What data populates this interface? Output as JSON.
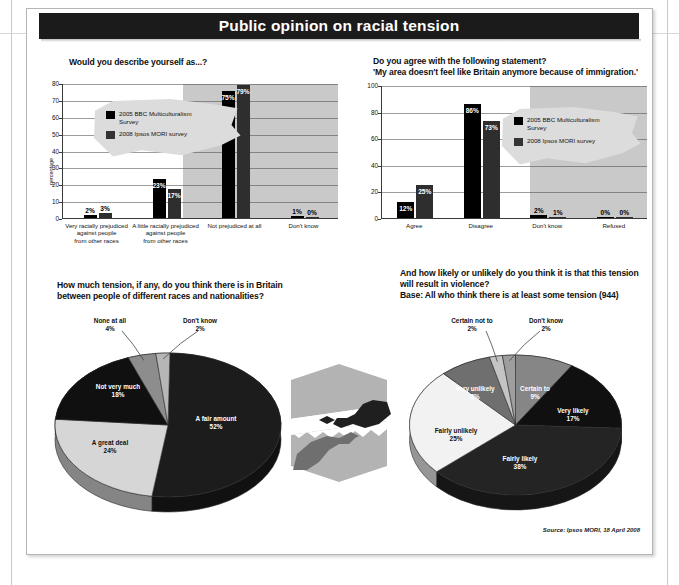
{
  "header": {
    "title": "Public opinion on racial tension"
  },
  "source": "Source: Ipsos MORI, 18 April 2008",
  "legend": {
    "series1": "2005 BBC Multiculturalism Survey",
    "series1_line1": "2005 BBC Multiculturalism",
    "series1_line2": "Survey",
    "series2": "2008 Ipsos MORI survey",
    "color1": "#000000",
    "color2": "#333333"
  },
  "chart_data": [
    {
      "type": "bar",
      "id": "self-description",
      "title": "Would you describe yourself as...?",
      "ylabel": "percentage",
      "xlabel": "",
      "ylim": [
        0,
        80
      ],
      "yticks": [
        0,
        10,
        20,
        30,
        40,
        50,
        60,
        70,
        80
      ],
      "grid": true,
      "categories": [
        "Very racially prejudiced against people from other races",
        "A little racially prejudiced against people from other races",
        "Not prejudiced at all",
        "Don't know"
      ],
      "category_lines": [
        [
          "Very racially prejudiced",
          "against people",
          "from other races"
        ],
        [
          "A little racially prejudiced",
          "against people",
          "from other races"
        ],
        [
          "Not prejudiced at all"
        ],
        [
          "Don't know"
        ]
      ],
      "series": [
        {
          "name": "2005 BBC Multiculturalism Survey",
          "values": [
            2,
            23,
            75,
            1
          ],
          "labels": [
            "2%",
            "23%",
            "75%",
            "1%"
          ]
        },
        {
          "name": "2008 Ipsos MORI survey",
          "values": [
            3,
            17,
            79,
            0
          ],
          "labels": [
            "3%",
            "17%",
            "79%",
            "0%"
          ]
        }
      ],
      "legend_position": "upper-left"
    },
    {
      "type": "bar",
      "id": "area-immigration",
      "title_line1": "Do you agree with the following statement?",
      "title_line2": "'My area doesn't feel like Britain anymore because of immigration.'",
      "ylabel": "",
      "ylim": [
        0,
        100
      ],
      "yticks": [
        0,
        20,
        40,
        60,
        80,
        100
      ],
      "grid": true,
      "categories": [
        "Agree",
        "Disagree",
        "Don't know",
        "Refused"
      ],
      "series": [
        {
          "name": "2005 BBC Multiculturalism Survey",
          "values": [
            12,
            86,
            2,
            0
          ],
          "labels": [
            "12%",
            "86%",
            "2%",
            "0%"
          ]
        },
        {
          "name": "2008 Ipsos MORI survey",
          "values": [
            25,
            73,
            1,
            0
          ],
          "labels": [
            "25%",
            "73%",
            "1%",
            "0%"
          ]
        }
      ],
      "legend_position": "upper-right"
    },
    {
      "type": "pie",
      "id": "tension-level",
      "title_line1": "How much tension, if any, do you think there is in Britain",
      "title_line2": "between people of different races and nationalities?",
      "categories": [
        "A fair amount",
        "A great deal",
        "Not very much",
        "None at all",
        "Don't know"
      ],
      "values": [
        52,
        24,
        18,
        4,
        2
      ],
      "labels": [
        "52%",
        "24%",
        "18%",
        "4%",
        "2%"
      ],
      "colors": [
        "#1c1c1c",
        "#d6d6d6",
        "#101010",
        "#8d8d8d",
        "#b6b6b6"
      ]
    },
    {
      "type": "pie",
      "id": "violence-likelihood",
      "title_line1": "And how likely or unlikely do you think it is that this tension",
      "title_line2": "will result in violence?",
      "title_line3": "Base: All who think there is at least some tension (944)",
      "categories": [
        "Certain to",
        "Very likely",
        "Fairly likely",
        "Fairly unlikely",
        "Very unlikely",
        "Certain not to",
        "Don't know"
      ],
      "values": [
        9,
        17,
        38,
        25,
        8,
        2,
        2
      ],
      "labels": [
        "9%",
        "17%",
        "38%",
        "25%",
        "8%",
        "2%",
        "2%"
      ],
      "colors": [
        "#868686",
        "#101010",
        "#242424",
        "#f2f2f2",
        "#6f6f6f",
        "#c4c4c4",
        "#9e9e9e"
      ]
    }
  ],
  "illustration": {
    "name": "two-hands-reaching-across-torn-paper"
  }
}
